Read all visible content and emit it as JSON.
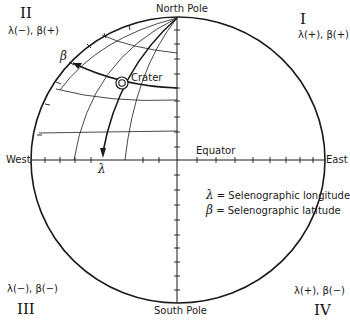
{
  "diagram": {
    "poles": {
      "north": "North Pole",
      "south": "South Pole"
    },
    "directions": {
      "west": "West",
      "east": "East"
    },
    "equator_label": "Equator",
    "crater_label": "Crater",
    "axis_symbols": {
      "longitude": "λ",
      "latitude": "β"
    },
    "quadrants": [
      {
        "numeral": "I",
        "signs": "λ(+), β(+)",
        "position": "top-right"
      },
      {
        "numeral": "II",
        "signs": "λ(−), β(+)",
        "position": "top-left"
      },
      {
        "numeral": "III",
        "signs": "λ(−), β(−)",
        "position": "bottom-left"
      },
      {
        "numeral": "IV",
        "signs": "λ(+), β(−)",
        "position": "bottom-right"
      }
    ],
    "legend": [
      {
        "symbol": "λ",
        "text": "= Selenographic longitude"
      },
      {
        "symbol": "β",
        "text": "= Selenographic latitude"
      }
    ],
    "colors": {
      "ink": "#1a1a1a",
      "background": "#ffffff"
    }
  }
}
